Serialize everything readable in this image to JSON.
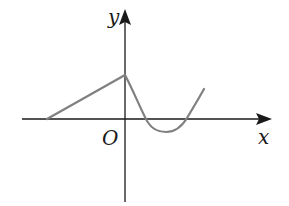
{
  "diagram": {
    "type": "function-graph",
    "labels": {
      "y_axis": "y",
      "x_axis": "x",
      "origin": "O"
    },
    "colors": {
      "axes": "#1a1a1a",
      "curve": "#808080",
      "background": "#ffffff"
    },
    "geometry": {
      "origin_px": [
        125,
        119
      ],
      "x_axis_px": {
        "from": 22,
        "to": 272
      },
      "y_axis_px": {
        "from": 202,
        "to": 8
      },
      "linear_segment": [
        [
          47,
          119
        ],
        [
          125,
          75
        ]
      ],
      "curve_points": [
        [
          125,
          75
        ],
        [
          146,
          119
        ],
        [
          166,
          131
        ],
        [
          186,
          119
        ],
        [
          204,
          90
        ]
      ]
    }
  }
}
